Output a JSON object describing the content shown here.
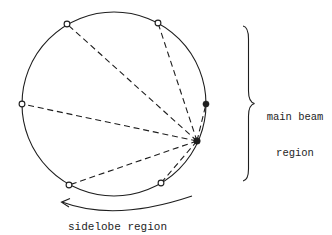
{
  "diagram": {
    "background_color": "#ffffff",
    "stroke_color": "#1e1e1e",
    "labels": {
      "main_beam_line1": "main beam",
      "main_beam_line2": "region",
      "sidelobe": "sidelobe region"
    },
    "circle": {
      "cx": 114,
      "cy": 104,
      "r": 92
    },
    "vertex_point": {
      "x": 197,
      "y": 141,
      "type": "filled"
    },
    "main_beam_point": {
      "x": 206,
      "y": 104,
      "type": "filled"
    },
    "open_points": [
      {
        "x": 67,
        "y": 24
      },
      {
        "x": 158,
        "y": 23
      },
      {
        "x": 22,
        "y": 104
      },
      {
        "x": 69,
        "y": 185
      },
      {
        "x": 161,
        "y": 183
      }
    ],
    "dashed_ray_count": 6,
    "annotations": {
      "brace_side": "right",
      "sidelobe_arrow_direction": "counterclockwise toward lower-left"
    }
  }
}
